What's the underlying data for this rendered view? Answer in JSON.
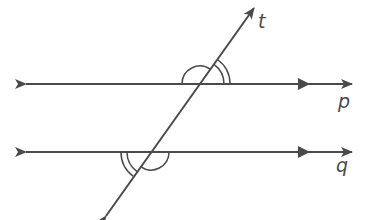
{
  "diagram": {
    "type": "parallel-lines-cut-by-transversal",
    "colors": {
      "line": "#4a4a4a",
      "background": "#ffffff"
    },
    "lines": [
      {
        "id": "p",
        "label": "p",
        "y": 84,
        "x_start": 24,
        "x_end": 354,
        "parallel_marks": 1
      },
      {
        "id": "q",
        "label": "q",
        "y": 152,
        "x_start": 24,
        "x_end": 354,
        "parallel_marks": 1
      }
    ],
    "transversal": {
      "label": "t",
      "from": [
        106,
        216
      ],
      "to": [
        254,
        8
      ]
    },
    "intersections": [
      {
        "line": "p",
        "point": [
          200,
          84
        ],
        "single_arc": "upper-left (obtuse)",
        "double_arc": "upper-right (acute)"
      },
      {
        "line": "q",
        "point": [
          151,
          152
        ],
        "single_arc": "lower-right (obtuse)",
        "double_arc": "lower-left (acute)"
      }
    ]
  },
  "labels": {
    "t": "t",
    "p": "p",
    "q": "q"
  }
}
